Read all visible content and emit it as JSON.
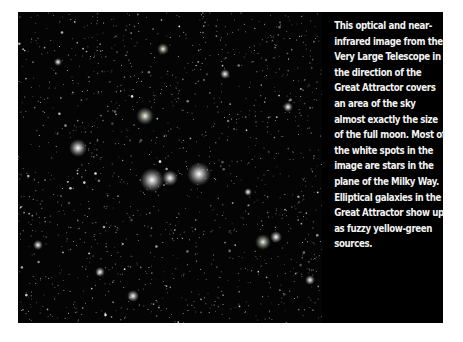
{
  "figure": {
    "image_alt": "Starfield image of the Great Attractor region taken by the Very Large Telescope",
    "caption": "This optical and near-infrared image from the Very Large Telescope in the direction of the Great Attractor covers an area of the sky almost exactly the size of the full moon. Most of the white spots in the image are stars in the plane of the Milky Way. Elliptical galaxies in the Great Attractor show up as fuzzy yellow-green sources."
  },
  "colors": {
    "page_background": "#ffffff",
    "panel_background": "#000000",
    "caption_text": "#f2f2f2"
  }
}
